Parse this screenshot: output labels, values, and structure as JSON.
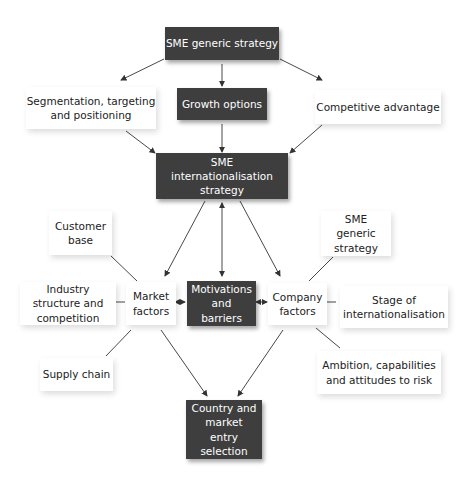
{
  "diagram": {
    "colors": {
      "dark_node": "#3e3e3e",
      "dark_text": "#ffffff",
      "light_text": "#222222",
      "edge": "#333333"
    },
    "nodes": {
      "sme_generic_strategy_top": "SME generic strategy",
      "growth_options": "Growth options",
      "segmentation": "Segmentation, targeting and positioning",
      "competitive_advantage": "Competitive advantage",
      "sme_internationalisation_strategy": "SME internationalisation strategy",
      "customer_base": "Customer base",
      "sme_generic_strategy_right": "SME generic strategy",
      "industry_structure": "Industry structure and competition",
      "market_factors": "Market factors",
      "motivations_barriers": "Motivations and barriers",
      "company_factors": "Company factors",
      "stage_of_internationalisation": "Stage of internationalisation",
      "supply_chain": "Supply chain",
      "ambition": "Ambition, capabilities and attitudes to risk",
      "country_market_entry": "Country and market entry selection"
    },
    "edges": [
      {
        "from": "SME generic strategy",
        "to": "Segmentation, targeting and positioning",
        "type": "arrow"
      },
      {
        "from": "SME generic strategy",
        "to": "Growth options",
        "type": "arrow"
      },
      {
        "from": "SME generic strategy",
        "to": "Competitive advantage",
        "type": "arrow"
      },
      {
        "from": "Segmentation, targeting and positioning",
        "to": "SME internationalisation strategy",
        "type": "arrow"
      },
      {
        "from": "Growth options",
        "to": "SME internationalisation strategy",
        "type": "arrow"
      },
      {
        "from": "Competitive advantage",
        "to": "SME internationalisation strategy",
        "type": "arrow"
      },
      {
        "from": "SME internationalisation strategy",
        "to": "Market factors",
        "type": "arrow"
      },
      {
        "from": "SME internationalisation strategy",
        "to": "Motivations and barriers",
        "type": "bidirectional"
      },
      {
        "from": "SME internationalisation strategy",
        "to": "Company factors",
        "type": "arrow"
      },
      {
        "from": "Market factors",
        "to": "Motivations and barriers",
        "type": "bidirectional"
      },
      {
        "from": "Motivations and barriers",
        "to": "Company factors",
        "type": "bidirectional"
      },
      {
        "from": "Customer base",
        "to": "Market factors",
        "type": "line"
      },
      {
        "from": "Industry structure and competition",
        "to": "Market factors",
        "type": "line"
      },
      {
        "from": "Supply chain",
        "to": "Market factors",
        "type": "line"
      },
      {
        "from": "SME generic strategy",
        "to": "Company factors",
        "type": "line"
      },
      {
        "from": "Stage of internationalisation",
        "to": "Company factors",
        "type": "line"
      },
      {
        "from": "Ambition, capabilities and attitudes to risk",
        "to": "Company factors",
        "type": "line"
      },
      {
        "from": "Market factors",
        "to": "Country and market entry selection",
        "type": "arrow"
      },
      {
        "from": "Company factors",
        "to": "Country and market entry selection",
        "type": "arrow"
      }
    ]
  }
}
